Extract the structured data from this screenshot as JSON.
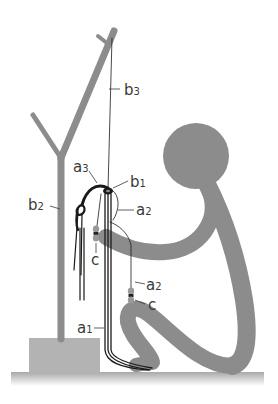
{
  "diagram": {
    "type": "illustration",
    "colors": {
      "figure": "#8c8c8c",
      "stand": "#8c8c8c",
      "box": "#b3b3b3",
      "floor": "#b8b8b8",
      "thread": "#1a1a1a",
      "label": "#3a3a3a",
      "background": "#ffffff"
    },
    "labels": {
      "b3": {
        "base": "b",
        "sub": "3"
      },
      "a3": {
        "base": "a",
        "sub": "3"
      },
      "b1": {
        "base": "b",
        "sub": "1"
      },
      "b2": {
        "base": "b",
        "sub": "2"
      },
      "a2_upper": {
        "base": "a",
        "sub": "2"
      },
      "c_left": {
        "base": "c",
        "sub": ""
      },
      "a2_lower": {
        "base": "a",
        "sub": "2"
      },
      "c_right": {
        "base": "c",
        "sub": ""
      },
      "a1": {
        "base": "a",
        "sub": "1"
      }
    }
  }
}
